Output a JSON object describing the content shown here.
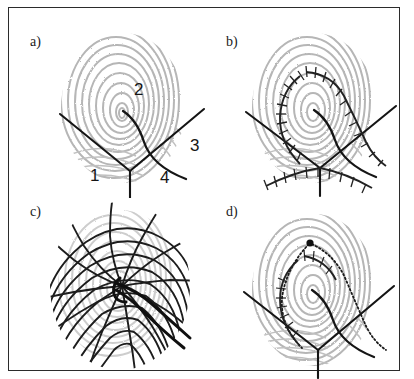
{
  "figure": {
    "type": "multi-panel-figure",
    "background_color": "#ffffff",
    "frame_color": "#2b2b2b",
    "ridge_color": "#a0a0a0",
    "overlay_color": "#151515",
    "panel_count": 4,
    "grid": "2x2"
  },
  "panels": [
    {
      "id": "a",
      "label": "a)",
      "overlay_name": "region-partition-lines",
      "description_name": "fingerprint-with-numbered-regions",
      "region_labels": [
        {
          "name": "region-1",
          "text": "1",
          "x": 78,
          "y": 158
        },
        {
          "name": "region-2",
          "text": "2",
          "x": 122,
          "y": 72
        },
        {
          "name": "region-3",
          "text": "3",
          "x": 180,
          "y": 128
        },
        {
          "name": "region-4",
          "text": "4",
          "x": 150,
          "y": 160
        }
      ]
    },
    {
      "id": "b",
      "label": "b)",
      "overlay_name": "hatched-ridge-tracks",
      "description_name": "fingerprint-with-ladder-curves"
    },
    {
      "id": "c",
      "label": "c)",
      "overlay_name": "curvilinear-coordinate-mesh",
      "description_name": "fingerprint-with-orthogonal-grid"
    },
    {
      "id": "d",
      "label": "d)",
      "overlay_name": "dotted-trajectory-paths",
      "description_name": "fingerprint-with-singular-point-marker"
    }
  ],
  "colors": {
    "frame": "#2b2b2b",
    "ridges": "#a0a0a0",
    "lines": "#151515",
    "page": "#ffffff"
  }
}
